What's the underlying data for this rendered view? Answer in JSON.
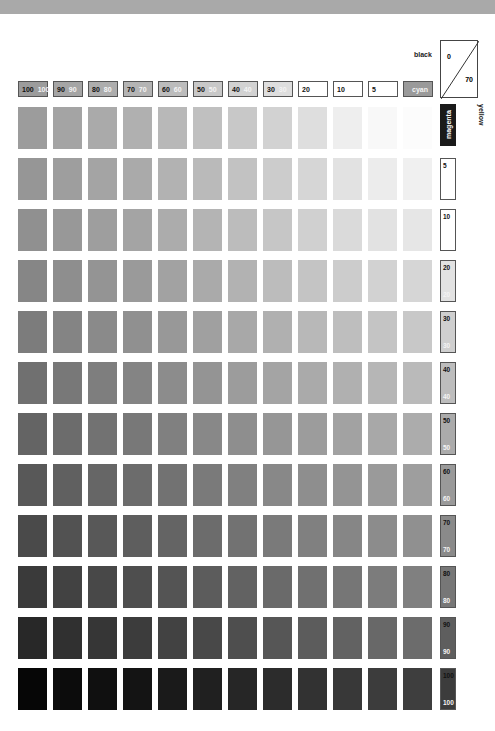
{
  "chart_data": {
    "type": "heatmap",
    "title": "",
    "xlabel": "cyan / magenta",
    "ylabel": "yellow / black",
    "corner_labels": {
      "black": "black",
      "top": "0",
      "bottom": "70",
      "yellow": "yellow",
      "magenta": "magenta"
    },
    "columns": [
      {
        "a": "100",
        "b": "100",
        "fill": "#9c9c9c"
      },
      {
        "a": "90",
        "b": "90",
        "fill": "#a5a5a5"
      },
      {
        "a": "80",
        "b": "80",
        "fill": "#adadad"
      },
      {
        "a": "70",
        "b": "70",
        "fill": "#b4b4b4"
      },
      {
        "a": "60",
        "b": "60",
        "fill": "#bcbcbc"
      },
      {
        "a": "50",
        "b": "50",
        "fill": "#c8c8c8"
      },
      {
        "a": "40",
        "b": "40",
        "fill": "#d2d2d2"
      },
      {
        "a": "30",
        "b": "30",
        "fill": "#dedede"
      },
      {
        "a": "20",
        "b": "",
        "fill": "#ffffff"
      },
      {
        "a": "10",
        "b": "",
        "fill": "#ffffff"
      },
      {
        "a": "5",
        "b": "",
        "fill": "#ffffff"
      },
      {
        "a": "",
        "b": "cyan",
        "fill": "#9a9a9a"
      }
    ],
    "rows": [
      {
        "a": "",
        "b": ""
      },
      {
        "a": "5",
        "b": ""
      },
      {
        "a": "10",
        "b": ""
      },
      {
        "a": "20",
        "b": "20"
      },
      {
        "a": "30",
        "b": "30"
      },
      {
        "a": "40",
        "b": "40"
      },
      {
        "a": "50",
        "b": "50"
      },
      {
        "a": "60",
        "b": "60"
      },
      {
        "a": "70",
        "b": "70"
      },
      {
        "a": "80",
        "b": "80"
      },
      {
        "a": "90",
        "b": "90"
      },
      {
        "a": "100",
        "b": "100"
      }
    ],
    "row_side_fills": [
      "#1a1a1a",
      "#ffffff",
      "#ffffff",
      "#e2e2e2",
      "#cfcfcf",
      "#bdbdbd",
      "#ababab",
      "#9a9a9a",
      "#8a8a8a",
      "#777777",
      "#5e5e5e",
      "#3c3c3c"
    ],
    "grid_gray_values": [
      [
        156,
        164,
        170,
        176,
        184,
        192,
        200,
        210,
        222,
        238,
        248,
        252
      ],
      [
        150,
        158,
        164,
        170,
        178,
        186,
        194,
        204,
        214,
        226,
        236,
        240
      ],
      [
        144,
        152,
        158,
        164,
        172,
        180,
        188,
        198,
        208,
        218,
        226,
        230
      ],
      [
        134,
        142,
        148,
        154,
        162,
        170,
        178,
        188,
        196,
        204,
        210,
        214
      ],
      [
        124,
        132,
        138,
        144,
        152,
        160,
        168,
        176,
        184,
        190,
        196,
        200
      ],
      [
        112,
        120,
        126,
        132,
        140,
        148,
        156,
        164,
        170,
        176,
        182,
        186
      ],
      [
        100,
        108,
        114,
        120,
        128,
        136,
        142,
        150,
        156,
        162,
        168,
        172
      ],
      [
        88,
        96,
        102,
        108,
        114,
        122,
        128,
        136,
        142,
        148,
        154,
        158
      ],
      [
        74,
        82,
        88,
        94,
        100,
        108,
        114,
        122,
        128,
        134,
        140,
        144
      ],
      [
        58,
        66,
        72,
        78,
        84,
        92,
        98,
        106,
        112,
        118,
        124,
        128
      ],
      [
        40,
        48,
        54,
        60,
        66,
        72,
        78,
        86,
        92,
        98,
        104,
        108
      ],
      [
        6,
        12,
        16,
        20,
        26,
        32,
        38,
        44,
        50,
        56,
        60,
        62
      ]
    ]
  }
}
